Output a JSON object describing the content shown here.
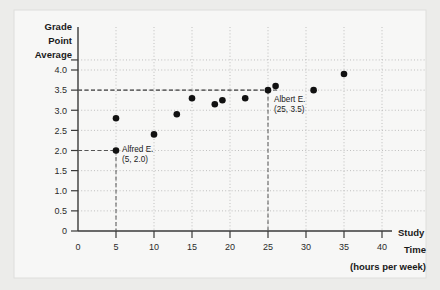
{
  "chart_data": {
    "type": "scatter",
    "title": "",
    "ylabel_lines": [
      "Grade",
      "Point",
      "Average"
    ],
    "xlabel_lines": [
      "Study",
      "Time",
      "(hours per week)"
    ],
    "xlabel": "Study Time (hours per week)",
    "ylabel": "Grade Point Average",
    "xlim": [
      0,
      40
    ],
    "ylim": [
      0,
      4.25
    ],
    "xticks": [
      0,
      5,
      10,
      15,
      20,
      25,
      30,
      35,
      40
    ],
    "xtick_labels": [
      "0",
      "5",
      "10",
      "15",
      "20",
      "25",
      "30",
      "35",
      "40"
    ],
    "yticks": [
      0,
      0.5,
      1.0,
      1.5,
      2.0,
      2.5,
      3.0,
      3.5,
      4.0
    ],
    "ytick_labels": [
      "0",
      "0.5",
      "1.0",
      "1.5",
      "2.0",
      "2.5",
      "3.0",
      "3.5",
      "4.0"
    ],
    "grid": true,
    "grid_style": "dotted",
    "legend": "none",
    "points": [
      {
        "x": 5,
        "y": 2.8
      },
      {
        "x": 5,
        "y": 2.0
      },
      {
        "x": 10,
        "y": 2.4
      },
      {
        "x": 13,
        "y": 2.9
      },
      {
        "x": 15,
        "y": 3.3
      },
      {
        "x": 18,
        "y": 3.15
      },
      {
        "x": 19,
        "y": 3.25
      },
      {
        "x": 22,
        "y": 3.3
      },
      {
        "x": 25,
        "y": 3.5
      },
      {
        "x": 26,
        "y": 3.6
      },
      {
        "x": 31,
        "y": 3.5
      },
      {
        "x": 35,
        "y": 3.9
      }
    ],
    "annotations": [
      {
        "name": "alfred-e",
        "label": "Alfred E.",
        "coords_label": "(5, 2.0)",
        "point": {
          "x": 5,
          "y": 2.0
        },
        "guide_x": true,
        "guide_y": true
      },
      {
        "name": "albert-e",
        "label": "Albert E.",
        "coords_label": "(25, 3.5)",
        "point": {
          "x": 25,
          "y": 3.5
        },
        "guide_x": true,
        "guide_y": true
      }
    ],
    "colors": {
      "point": "#111111",
      "axis": "#3a3a3a",
      "grid": "#b8b8b8",
      "guide": "#555555",
      "background": "#ffffff",
      "page_background": "#ececea",
      "text": "#1a1a1a"
    }
  }
}
